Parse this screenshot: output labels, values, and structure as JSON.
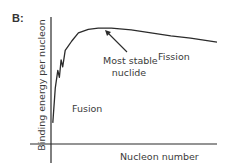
{
  "panel_label": "B:",
  "chart_data": {
    "type": "line",
    "title": "",
    "xlabel": "Nucleon number",
    "ylabel": "Binding energy per nucleon",
    "x_ticks": [],
    "y_ticks": [],
    "grid": false,
    "legend": "none",
    "xlim": [
      0,
      100
    ],
    "ylim": [
      0,
      100
    ],
    "series": [
      {
        "name": "Binding energy curve",
        "color": "#2b2b2b",
        "x": [
          0.5,
          2,
          3.5,
          4.5,
          5.5,
          6.5,
          8,
          9.5,
          12,
          16,
          22,
          28,
          36,
          48,
          60,
          72,
          84,
          100
        ],
        "y": [
          18,
          48,
          63,
          57,
          72,
          66,
          80,
          83,
          88,
          95,
          98,
          99,
          99,
          97.5,
          95,
          92.5,
          90.5,
          87
        ]
      }
    ],
    "annotations": [
      {
        "text_line1": "Most stable",
        "text_line2": "nuclide",
        "points_to": {
          "x": 28,
          "y": 99
        }
      },
      {
        "text": "Fission"
      },
      {
        "text": "Fusion"
      }
    ]
  }
}
